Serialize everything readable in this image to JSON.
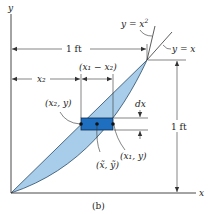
{
  "figure": {
    "caption": "(b)",
    "axes": {
      "x_label": "x",
      "y_label": "y"
    },
    "curves": [
      {
        "label": "y = x²",
        "label_base": "y = x",
        "label_sup": "2"
      },
      {
        "label": "y = x"
      }
    ],
    "dimensions": {
      "top_width": "1 ft",
      "right_height": "1 ft",
      "x2": "x₂",
      "x1_minus_x2": "(x₁ − x₂)",
      "dx": "dx"
    },
    "points": {
      "left": "(x₂, y)",
      "right": "(x₁, y)",
      "centroid": "(x̃, ỹ)"
    },
    "colors": {
      "region_fill": "#a8cdea",
      "element_fill": "#1f6fc0",
      "line": "#333333"
    }
  }
}
